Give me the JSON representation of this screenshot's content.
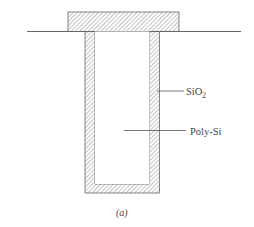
{
  "figure": {
    "caption": "(a)",
    "labels": {
      "oxide": "SiO",
      "oxide_subscript": "2",
      "poly": "Poly-Si"
    },
    "colors": {
      "line": "#555555",
      "hatch": "#777777",
      "background": "#ffffff"
    }
  }
}
